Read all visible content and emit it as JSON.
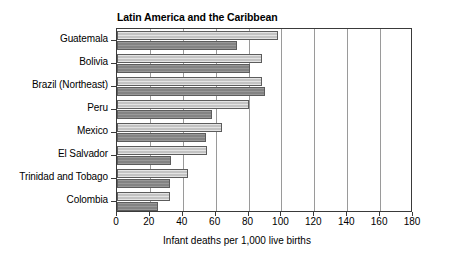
{
  "chart_data": {
    "type": "bar",
    "orientation": "horizontal",
    "title": "Latin America and the Caribbean",
    "xlabel": "Infant deaths per 1,000 live births",
    "ylabel": "",
    "xlim": [
      0,
      180
    ],
    "xticks": [
      0,
      20,
      40,
      60,
      80,
      100,
      120,
      140,
      160,
      180
    ],
    "grid": true,
    "legend": null,
    "categories": [
      "Guatemala",
      "Bolivia",
      "Brazil (Northeast)",
      "Peru",
      "Mexico",
      "El Salvador",
      "Trinidad and Tobago",
      "Colombia"
    ],
    "series": [
      {
        "name": "light",
        "color": "#c3c3c3",
        "values": [
          98,
          88,
          88,
          80,
          64,
          55,
          43,
          32
        ]
      },
      {
        "name": "dark",
        "color": "#838383",
        "values": [
          73,
          81,
          90,
          58,
          54,
          33,
          32,
          25
        ]
      }
    ]
  }
}
